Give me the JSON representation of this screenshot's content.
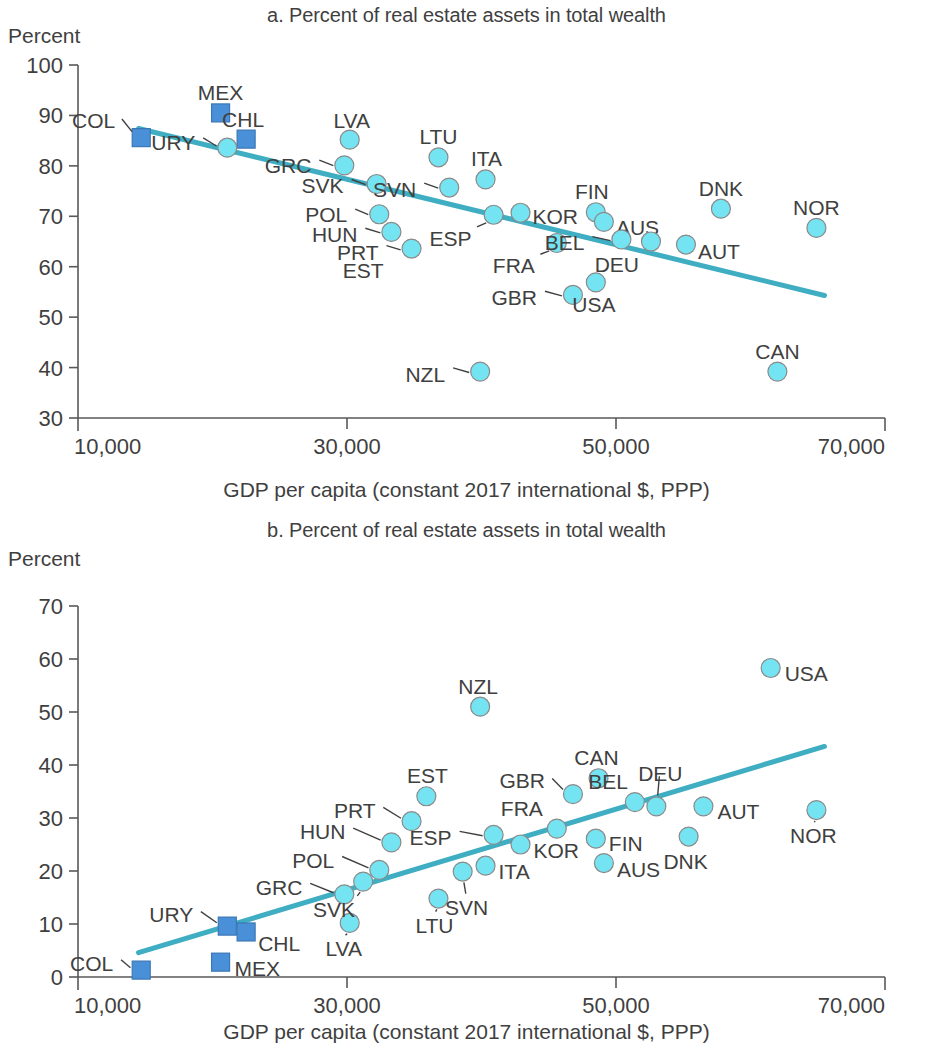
{
  "figure": {
    "y_axis_unit_label": "Percent",
    "x_axis_title": "GDP per capita (constant 2017 international $, PPP)"
  },
  "chart_data": [
    {
      "id": "a",
      "type": "scatter",
      "title": "a. Percent of real estate assets in total wealth",
      "xlabel": "GDP per capita (constant 2017 international $, PPP)",
      "ylabel": "Percent",
      "xlim": [
        10000,
        70000
      ],
      "ylim": [
        30,
        100
      ],
      "xticks": [
        10000,
        30000,
        50000,
        70000
      ],
      "xticklabels": [
        "10,000",
        "30,000",
        "50,000",
        "70,000"
      ],
      "yticks": [
        30,
        40,
        50,
        60,
        70,
        80,
        90,
        100
      ],
      "yticklabels": [
        "30",
        "40",
        "50",
        "60",
        "70",
        "80",
        "90",
        "100"
      ],
      "grid": false,
      "legend": "none",
      "trendline": {
        "x0": 14500,
        "y0": 87.4,
        "x1": 65500,
        "y1": 54.3
      },
      "points": [
        {
          "label": "COL",
          "x": 14700,
          "y": 85.6,
          "marker": "square",
          "label_dx": -26,
          "label_dy": -17
        },
        {
          "label": "MEX",
          "x": 20600,
          "y": 90.5,
          "marker": "square",
          "label_dx": 0,
          "label_dy": -20
        },
        {
          "label": "CHL",
          "x": 22500,
          "y": 85.3,
          "marker": "square",
          "label_dx": -3,
          "label_dy": -19
        },
        {
          "label": "URY",
          "x": 21100,
          "y": 83.6,
          "marker": "circle",
          "label_dx": -32,
          "label_dy": -5
        },
        {
          "label": "GRC",
          "x": 29800,
          "y": 80.1,
          "marker": "circle",
          "label_dx": -33,
          "label_dy": 1
        },
        {
          "label": "LVA",
          "x": 30200,
          "y": 85.2,
          "marker": "circle",
          "label_dx": 2,
          "label_dy": -19
        },
        {
          "label": "SVK",
          "x": 32200,
          "y": 76.4,
          "marker": "circle",
          "label_dx": -33,
          "label_dy": 2
        },
        {
          "label": "LTU",
          "x": 36800,
          "y": 81.7,
          "marker": "circle",
          "label_dx": 0,
          "label_dy": -20
        },
        {
          "label": "POL",
          "x": 32400,
          "y": 70.4,
          "marker": "circle",
          "label_dx": -32,
          "label_dy": 1
        },
        {
          "label": "HUN",
          "x": 33300,
          "y": 66.9,
          "marker": "circle",
          "label_dx": -34,
          "label_dy": 3
        },
        {
          "label": "PRT",
          "x": 34800,
          "y": 63.6,
          "marker": "circle",
          "label_dx": -33,
          "label_dy": 4
        },
        {
          "label": "EST",
          "x": 34800,
          "y": 63.6,
          "marker": "none",
          "label_dx": -28,
          "label_dy": 22
        },
        {
          "label": "SVN",
          "x": 37600,
          "y": 75.7,
          "marker": "circle",
          "label_dx": -33,
          "label_dy": 2
        },
        {
          "label": "ITA",
          "x": 40300,
          "y": 77.3,
          "marker": "circle",
          "label_dx": 1,
          "label_dy": -20
        },
        {
          "label": "ESP",
          "x": 40900,
          "y": 70.3,
          "marker": "circle",
          "label_dx": -22,
          "label_dy": 24
        },
        {
          "label": "KOR",
          "x": 42900,
          "y": 70.7,
          "marker": "circle",
          "label_dx": 12,
          "label_dy": 4
        },
        {
          "label": "FRA",
          "x": 45600,
          "y": 64.7,
          "marker": "circle",
          "label_dx": -22,
          "label_dy": 23
        },
        {
          "label": "FIN",
          "x": 48500,
          "y": 70.8,
          "marker": "circle",
          "label_dx": -4,
          "label_dy": -20
        },
        {
          "label": "AUS",
          "x": 49100,
          "y": 68.9,
          "marker": "circle",
          "label_dx": 12,
          "label_dy": 6
        },
        {
          "label": "GBR",
          "x": 46800,
          "y": 54.4,
          "marker": "circle",
          "label_dx": -36,
          "label_dy": 3
        },
        {
          "label": "USA",
          "x": 48500,
          "y": 56.9,
          "marker": "circle",
          "label_dx": -2,
          "label_dy": 23
        },
        {
          "label": "BEL",
          "x": 50400,
          "y": 65.4,
          "marker": "circle",
          "label_dx": -37,
          "label_dy": 4
        },
        {
          "label": "DEU",
          "x": 52600,
          "y": 65.0,
          "marker": "circle",
          "label_dx": -12,
          "label_dy": 23
        },
        {
          "label": "AUT",
          "x": 55200,
          "y": 64.4,
          "marker": "circle",
          "label_dx": 12,
          "label_dy": 7
        },
        {
          "label": "DNK",
          "x": 57800,
          "y": 71.5,
          "marker": "circle",
          "label_dx": 0,
          "label_dy": -20
        },
        {
          "label": "NOR",
          "x": 64900,
          "y": 67.7,
          "marker": "circle",
          "label_dx": 0,
          "label_dy": -20
        },
        {
          "label": "NZL",
          "x": 39900,
          "y": 39.2,
          "marker": "circle",
          "label_dx": -35,
          "label_dy": 3
        },
        {
          "label": "CAN",
          "x": 62000,
          "y": 39.2,
          "marker": "circle",
          "label_dx": 0,
          "label_dy": -20
        }
      ]
    },
    {
      "id": "b",
      "type": "scatter",
      "title": "b. Percent of real estate assets in total wealth",
      "xlabel": "GDP per capita (constant 2017 international $, PPP)",
      "ylabel": "Percent",
      "xlim": [
        10000,
        70000
      ],
      "ylim": [
        0,
        70
      ],
      "xticks": [
        10000,
        30000,
        50000,
        70000
      ],
      "xticklabels": [
        "10,000",
        "30,000",
        "50,000",
        "70,000"
      ],
      "yticks": [
        0,
        10,
        20,
        30,
        40,
        50,
        60,
        70
      ],
      "yticklabels": [
        "0",
        "10",
        "20",
        "30",
        "40",
        "50",
        "60",
        "70"
      ],
      "grid": false,
      "legend": "none",
      "trendline": {
        "x0": 14500,
        "y0": 4.6,
        "x1": 65500,
        "y1": 43.5
      },
      "points": [
        {
          "label": "COL",
          "x": 14700,
          "y": 1.3,
          "marker": "square",
          "label_dx": -28,
          "label_dy": -6
        },
        {
          "label": "MEX",
          "x": 20600,
          "y": 2.8,
          "marker": "square",
          "label_dx": 14,
          "label_dy": 7
        },
        {
          "label": "URY",
          "x": 21100,
          "y": 9.6,
          "marker": "square",
          "label_dx": -34,
          "label_dy": -11
        },
        {
          "label": "CHL",
          "x": 22500,
          "y": 8.5,
          "marker": "square",
          "label_dx": 12,
          "label_dy": 12
        },
        {
          "label": "GRC",
          "x": 29800,
          "y": 15.6,
          "marker": "circle",
          "label_dx": -42,
          "label_dy": -6
        },
        {
          "label": "LVA",
          "x": 30200,
          "y": 10.2,
          "marker": "circle",
          "label_dx": -6,
          "label_dy": 26
        },
        {
          "label": "SVK",
          "x": 31200,
          "y": 18.0,
          "marker": "circle",
          "label_dx": -8,
          "label_dy": 28
        },
        {
          "label": "POL",
          "x": 32400,
          "y": 20.2,
          "marker": "circle",
          "label_dx": -45,
          "label_dy": -9
        },
        {
          "label": "HUN",
          "x": 33300,
          "y": 25.4,
          "marker": "circle",
          "label_dx": -46,
          "label_dy": -10
        },
        {
          "label": "PRT",
          "x": 34800,
          "y": 29.4,
          "marker": "circle",
          "label_dx": -36,
          "label_dy": -10
        },
        {
          "label": "EST",
          "x": 35900,
          "y": 34.1,
          "marker": "circle",
          "label_dx": 1,
          "label_dy": -20
        },
        {
          "label": "LTU",
          "x": 36800,
          "y": 14.8,
          "marker": "circle",
          "label_dx": -4,
          "label_dy": 27
        },
        {
          "label": "SVN",
          "x": 38600,
          "y": 19.9,
          "marker": "circle",
          "label_dx": 4,
          "label_dy": 36
        },
        {
          "label": "ESP",
          "x": 40900,
          "y": 26.8,
          "marker": "circle",
          "label_dx": -42,
          "label_dy": 3
        },
        {
          "label": "NZL",
          "x": 39900,
          "y": 51.0,
          "marker": "circle",
          "label_dx": -2,
          "label_dy": -20
        },
        {
          "label": "ITA",
          "x": 40300,
          "y": 21.0,
          "marker": "circle",
          "label_dx": 13,
          "label_dy": 6
        },
        {
          "label": "KOR",
          "x": 42900,
          "y": 25.0,
          "marker": "circle",
          "label_dx": 13,
          "label_dy": 6
        },
        {
          "label": "FRA",
          "x": 45600,
          "y": 28.0,
          "marker": "circle",
          "label_dx": -14,
          "label_dy": -20
        },
        {
          "label": "GBR",
          "x": 46800,
          "y": 34.5,
          "marker": "circle",
          "label_dx": -28,
          "label_dy": -13
        },
        {
          "label": "CAN",
          "x": 48700,
          "y": 37.5,
          "marker": "circle",
          "label_dx": -2,
          "label_dy": -20
        },
        {
          "label": "FIN",
          "x": 48500,
          "y": 26.1,
          "marker": "circle",
          "label_dx": 13,
          "label_dy": 5
        },
        {
          "label": "AUS",
          "x": 49100,
          "y": 21.5,
          "marker": "circle",
          "label_dx": 13,
          "label_dy": 7
        },
        {
          "label": "BEL",
          "x": 51400,
          "y": 33.0,
          "marker": "circle",
          "label_dx": -7,
          "label_dy": -20
        },
        {
          "label": "DEU",
          "x": 53000,
          "y": 32.2,
          "marker": "circle",
          "label_dx": 4,
          "label_dy": -32
        },
        {
          "label": "DNK",
          "x": 55400,
          "y": 26.5,
          "marker": "circle",
          "label_dx": -3,
          "label_dy": 25
        },
        {
          "label": "AUT",
          "x": 56500,
          "y": 32.2,
          "marker": "circle",
          "label_dx": 14,
          "label_dy": 6
        },
        {
          "label": "NOR",
          "x": 64900,
          "y": 31.5,
          "marker": "circle",
          "label_dx": -3,
          "label_dy": 26
        },
        {
          "label": "USA",
          "x": 61500,
          "y": 58.3,
          "marker": "circle",
          "label_dx": 14,
          "label_dy": 6
        }
      ]
    }
  ]
}
